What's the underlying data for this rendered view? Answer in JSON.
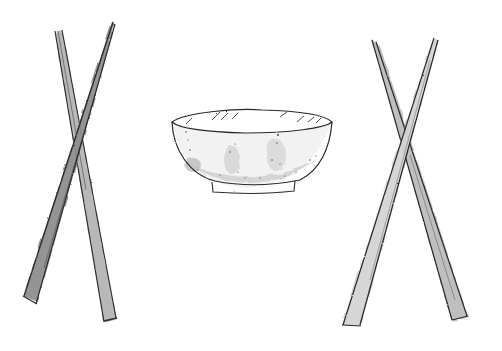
{
  "illustration": {
    "subject": "pen-and-watercolor sketch of a bowl between two pairs of crossed chopsticks",
    "background_color": "#ffffff",
    "ink_color": "#2a2a2a",
    "wash_dark": "#8a8a8a",
    "wash_light": "#c4c4c4",
    "objects": [
      {
        "name": "left-chopsticks",
        "type": "crossed chopsticks"
      },
      {
        "name": "bowl",
        "type": "empty bowl"
      },
      {
        "name": "right-chopsticks",
        "type": "crossed chopsticks"
      }
    ]
  }
}
